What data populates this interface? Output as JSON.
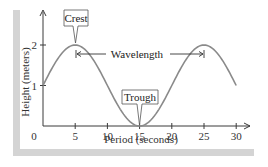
{
  "chart_data": {
    "type": "line",
    "title": "",
    "xlabel": "Period (seconds)",
    "ylabel": "Height (meters)",
    "x_ticks": [
      0,
      5,
      10,
      15,
      20,
      25,
      30
    ],
    "x_tick_labels": [
      "0",
      "5",
      "10",
      "15",
      "20",
      "25",
      "30"
    ],
    "y_ticks": [
      1,
      2
    ],
    "y_tick_labels": [
      "1",
      "2"
    ],
    "xlim": [
      0,
      32
    ],
    "ylim": [
      0,
      2.8
    ],
    "grid": false,
    "legend": null,
    "series": [
      {
        "name": "wave",
        "x": [
          0,
          2.5,
          5,
          7.5,
          10,
          12.5,
          15,
          17.5,
          20,
          22.5,
          25,
          27.5,
          30
        ],
        "y": [
          1,
          1.71,
          2,
          1.71,
          1,
          0.29,
          0,
          0.29,
          1,
          1.71,
          2,
          1.71,
          1
        ]
      }
    ],
    "annotations": [
      {
        "label": "Crest",
        "x": 5,
        "y": 2
      },
      {
        "label": "Trough",
        "x": 15,
        "y": 0
      },
      {
        "label": "Wavelength",
        "from_x": 5,
        "to_x": 25,
        "y": 1.8
      }
    ],
    "colors": {
      "curve": "#8a8a8a",
      "axis": "#3a3a3a",
      "frame": "#d4d4d4"
    }
  },
  "labels": {
    "crest": "Crest",
    "trough": "Trough",
    "wavelength": "Wavelength",
    "xlabel": "Period (seconds)",
    "ylabel": "Height (meters)"
  }
}
